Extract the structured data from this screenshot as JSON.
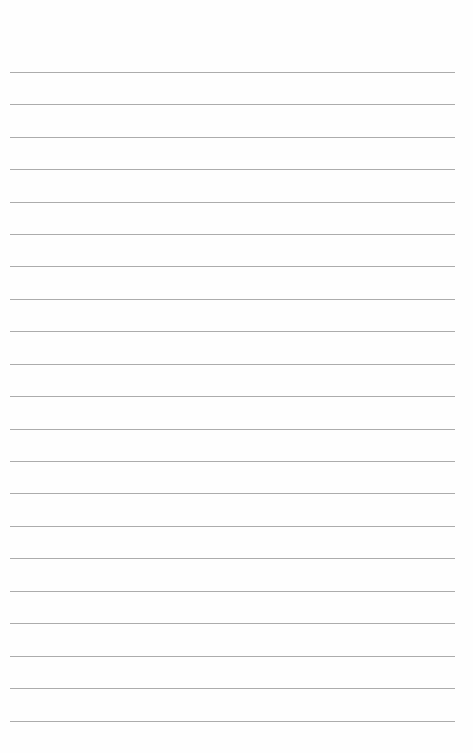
{
  "page": {
    "type": "lined-paper",
    "background_color": "#fefefe",
    "rule_color": "#9e9e9e",
    "rule_count": 21,
    "rule_left": 10,
    "rule_width": 445,
    "rules_y": [
      72,
      104,
      137,
      169,
      202,
      234,
      266,
      299,
      331,
      364,
      396,
      429,
      461,
      493,
      526,
      558,
      591,
      623,
      656,
      688,
      721
    ]
  }
}
